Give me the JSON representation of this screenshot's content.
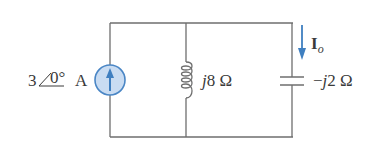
{
  "diagram": {
    "type": "circuit",
    "topology": "parallel",
    "colors": {
      "wire": "#6e6e6e",
      "source_fill": "#c9dcf2",
      "source_stroke": "#4a86c5",
      "arrow": "#3f7fc0",
      "text": "#3a3a3a"
    },
    "components": [
      {
        "id": "current-source",
        "kind": "current source",
        "label_magnitude": "3",
        "label_angle": "0°",
        "label_unit": "A",
        "direction": "up"
      },
      {
        "id": "inductor",
        "kind": "inductor",
        "label_j": "j",
        "label_value": "8 Ω"
      },
      {
        "id": "capacitor",
        "kind": "capacitor",
        "label_sign": "−",
        "label_j": "j",
        "label_value": "2 Ω"
      }
    ],
    "current_label": {
      "symbol": "I",
      "subscript": "o",
      "direction": "down",
      "branch": "capacitor"
    }
  }
}
